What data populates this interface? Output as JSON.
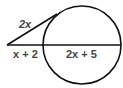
{
  "diagram": {
    "type": "circle-tangent-secant",
    "labels": {
      "tangent": "2x",
      "external_secant": "x + 2",
      "internal_secant": "2x + 5"
    },
    "colors": {
      "stroke": "#111111",
      "label": "#444444",
      "background": "#ffffff"
    }
  }
}
